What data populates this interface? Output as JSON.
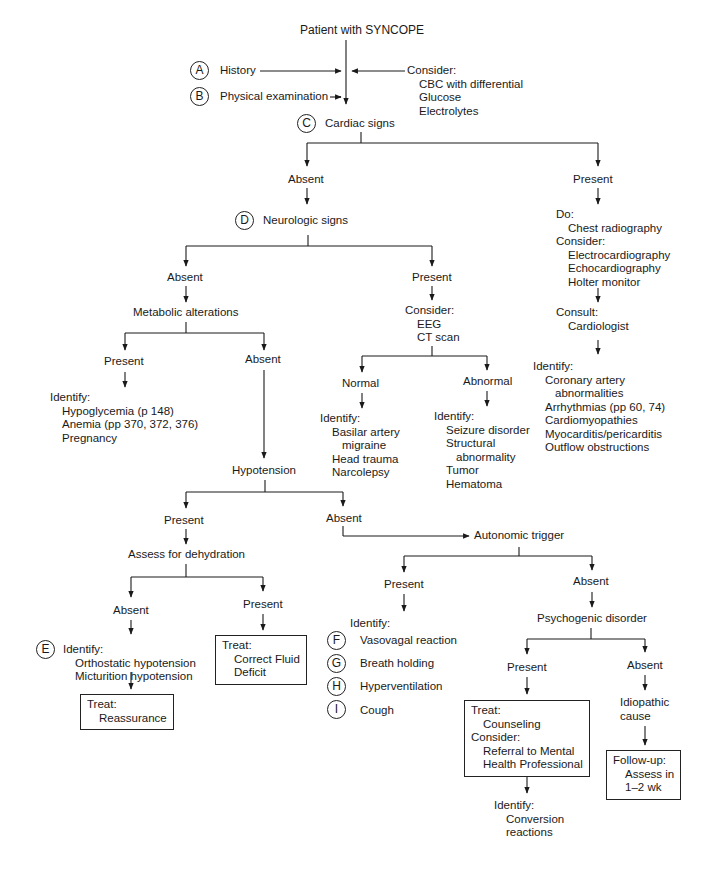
{
  "diagram": {
    "title": "Patient with SYNCOPE",
    "history": {
      "marker": "A",
      "label": "History"
    },
    "physical": {
      "marker": "B",
      "label": "Physical examination"
    },
    "consider_top": {
      "heading": "Consider:",
      "items": [
        "CBC with differential",
        "Glucose",
        "Electrolytes"
      ]
    },
    "cardiac": {
      "marker": "C",
      "label": "Cardiac signs"
    },
    "cardiac_absent": "Absent",
    "cardiac_present": {
      "label": "Present",
      "do_heading": "Do:",
      "do_items": [
        "Chest radiography"
      ],
      "consider_heading": "Consider:",
      "consider_items": [
        "Electrocardiography",
        "Echocardiography",
        "Holter monitor"
      ],
      "consult_heading": "Consult:",
      "consult_items": [
        "Cardiologist"
      ],
      "identify_heading": "Identify:",
      "identify_items": [
        "Coronary artery",
        "abnormalities",
        "Arrhythmias (pp 60, 74)",
        "Cardiomyopathies",
        "Myocarditis/pericarditis",
        "Outflow obstructions"
      ]
    },
    "neuro": {
      "marker": "D",
      "label": "Neurologic signs"
    },
    "neuro_absent": "Absent",
    "metabolic": {
      "label": "Metabolic alterations",
      "present": "Present",
      "absent": "Absent",
      "identify_heading": "Identify:",
      "identify_items": [
        "Hypoglycemia (p 148)",
        "Anemia (pp 370, 372, 376)",
        "Pregnancy"
      ]
    },
    "neuro_present": {
      "label": "Present",
      "consider_heading": "Consider:",
      "consider_items": [
        "EEG",
        "CT scan"
      ],
      "normal": {
        "label": "Normal",
        "identify_heading": "Identify:",
        "identify_items": [
          "Basilar artery",
          "migraine",
          "Head trauma",
          "Narcolepsy"
        ]
      },
      "abnormal": {
        "label": "Abnormal",
        "identify_heading": "Identify:",
        "identify_items": [
          "Seizure disorder",
          "Structural",
          "abnormality",
          "Tumor",
          "Hematoma"
        ]
      }
    },
    "hypotension": {
      "label": "Hypotension",
      "present": "Present",
      "absent": "Absent"
    },
    "dehydration": {
      "label": "Assess for dehydration",
      "absent": "Absent",
      "present": "Present",
      "identify_marker": "E",
      "identify_heading": "Identify:",
      "identify_items": [
        "Orthostatic hypotension",
        "Micturition hypotension"
      ],
      "treat_reassurance": {
        "heading": "Treat:",
        "item": "Reassurance"
      },
      "treat_fluid": {
        "heading": "Treat:",
        "items": [
          "Correct Fluid",
          "Deficit"
        ]
      }
    },
    "autonomic": {
      "label": "Autonomic trigger",
      "present": "Present",
      "absent": "Absent",
      "identify_heading": "Identify:",
      "triggers": [
        {
          "marker": "F",
          "label": "Vasovagal reaction"
        },
        {
          "marker": "G",
          "label": "Breath holding"
        },
        {
          "marker": "H",
          "label": "Hyperventilation"
        },
        {
          "marker": "I",
          "label": "Cough"
        }
      ]
    },
    "psychogenic": {
      "label": "Psychogenic disorder",
      "present": "Present",
      "absent": "Absent",
      "treat_box": {
        "treat_heading": "Treat:",
        "treat_items": [
          "Counseling"
        ],
        "consider_heading": "Consider:",
        "consider_items": [
          "Referral to Mental",
          "Health Professional"
        ]
      },
      "identify_heading": "Identify:",
      "identify_items": [
        "Conversion",
        "reactions"
      ],
      "idiopathic": [
        "Idiopathic",
        "cause"
      ],
      "followup_box": {
        "heading": "Follow-up:",
        "items": [
          "Assess in",
          "1–2 wk"
        ]
      }
    }
  },
  "colors": {
    "ink": "#1a1a1a",
    "paper": "#ffffff"
  }
}
